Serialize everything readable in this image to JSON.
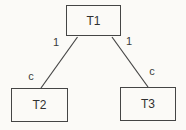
{
  "diagram": {
    "type": "tree",
    "nodes": [
      {
        "id": "t1",
        "label": "T1",
        "role": "root"
      },
      {
        "id": "t2",
        "label": "T2",
        "role": "child"
      },
      {
        "id": "t3",
        "label": "T3",
        "role": "child"
      }
    ],
    "edges": [
      {
        "from": "t1",
        "to": "t2",
        "label_near_parent": "1",
        "label_near_child": "c"
      },
      {
        "from": "t1",
        "to": "t3",
        "label_near_parent": "1",
        "label_near_child": "c"
      }
    ],
    "colors": {
      "background": "#fbfaf7",
      "line": "#454545",
      "box_border": "#454545",
      "text": "#303030"
    }
  }
}
